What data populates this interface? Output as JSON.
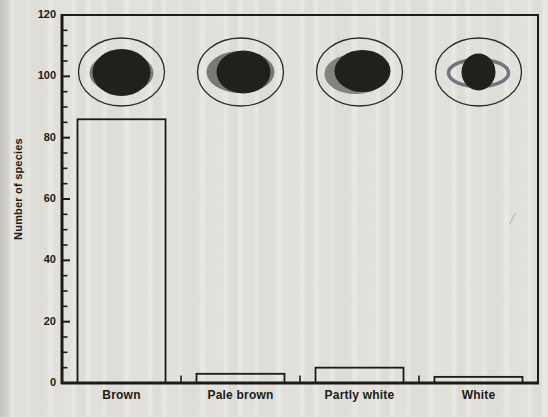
{
  "chart_data": {
    "type": "bar",
    "title": "",
    "ylabel": "Number of species",
    "xlabel": "",
    "ylim": [
      0,
      120
    ],
    "ytick_major": [
      0,
      20,
      40,
      60,
      80,
      100,
      120
    ],
    "ytick_minor_step": 5,
    "grid": false,
    "legend": "none",
    "categories": [
      "Brown",
      "Pale brown",
      "Partly white",
      "White"
    ],
    "values": [
      86,
      3,
      5,
      2
    ],
    "bar_style": "outlined, unfilled",
    "annotations": [
      {
        "icon": "brown-egg-icon",
        "category": "Brown"
      },
      {
        "icon": "pale-brown-egg-icon",
        "category": "Pale brown"
      },
      {
        "icon": "partly-white-egg-icon",
        "category": "Partly white"
      },
      {
        "icon": "white-egg-icon",
        "category": "White"
      }
    ]
  },
  "colors": {
    "ink": "#1c1b17",
    "paper": "#e9e8e3",
    "egg_dark": "#21201c",
    "egg_gray": "#7b7a72"
  }
}
